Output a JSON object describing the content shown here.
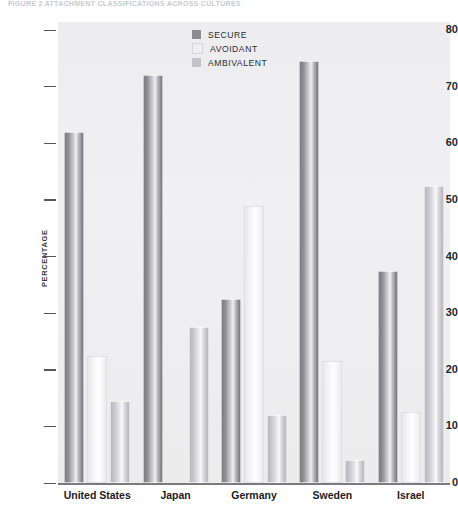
{
  "top_caption": "FIGURE 2  ATTACHMENT CLASSIFICATIONS ACROSS CULTURES",
  "chart_data": {
    "type": "bar",
    "title": "",
    "subtitle": "",
    "xlabel": "",
    "ylabel": "PERCENTAGE",
    "ylim": [
      0,
      80
    ],
    "yticks": [
      0,
      10,
      20,
      30,
      40,
      50,
      60,
      70,
      80
    ],
    "ytick_labels": [
      "0",
      "10",
      "20",
      "30",
      "40",
      "50",
      "60",
      "70",
      "80"
    ],
    "grid": false,
    "legend_position": "top-center",
    "categories": [
      "United States",
      "Japan",
      "Germany",
      "Sweden",
      "Israel"
    ],
    "series": [
      {
        "name": "SECURE",
        "color": "#8b8b91",
        "values": [
          62,
          72,
          32.5,
          74.5,
          37.5
        ]
      },
      {
        "name": "AVOIDANT",
        "color": "#eeeef0",
        "values": [
          22.5,
          0,
          49,
          21.5,
          12.5
        ]
      },
      {
        "name": "AMBIVALENT",
        "color": "#c3c3c8",
        "values": [
          14.5,
          27.5,
          12,
          4,
          52.5
        ]
      }
    ]
  },
  "legend": {
    "items": [
      {
        "label": "SECURE",
        "color": "#8b8b91"
      },
      {
        "label": "AVOIDANT",
        "color": "#eeeef0"
      },
      {
        "label": "AMBIVALENT",
        "color": "#c3c3c8"
      }
    ]
  }
}
